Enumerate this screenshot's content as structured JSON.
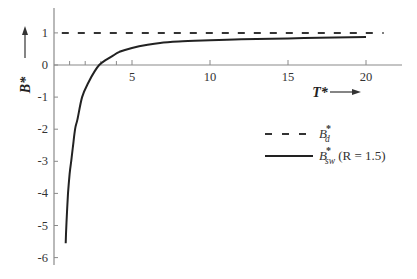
{
  "chart_data": {
    "type": "line",
    "title": "",
    "xlabel": "T*",
    "ylabel": "B*",
    "xlim": [
      0,
      21.5
    ],
    "ylim": [
      -6.2,
      1.7
    ],
    "x_ticks": [
      5,
      10,
      15,
      20
    ],
    "x_minor_ticks": [
      1,
      2,
      3,
      4
    ],
    "y_ticks": [
      1,
      0,
      -1,
      -2,
      -3,
      -4,
      -5,
      -6
    ],
    "x_tick_labels": [
      "5",
      "10",
      "15",
      "20"
    ],
    "y_tick_labels": [
      "1",
      "0",
      "-1",
      "-2",
      "-3",
      "-4",
      "-5",
      "-6"
    ],
    "grid": false,
    "legend_position": "right-center",
    "series": [
      {
        "name": "B*_d",
        "style": "dashed",
        "x": [
          0.5,
          20.5
        ],
        "y": [
          1,
          1
        ]
      },
      {
        "name": "B*_sw (R = 1.5)",
        "style": "solid",
        "x": [
          0.75,
          0.8,
          0.9,
          1.0,
          1.1,
          1.2,
          1.35,
          1.5,
          1.8,
          2.2,
          2.6,
          2.9,
          3.3,
          3.8,
          4.2,
          5.0,
          6.0,
          6.8,
          8.0,
          10.0,
          12.0,
          15.0,
          18.0,
          20.0
        ],
        "y": [
          -5.55,
          -4.9,
          -4.0,
          -3.4,
          -3.0,
          -2.6,
          -2.0,
          -1.7,
          -1.0,
          -0.55,
          -0.2,
          0.0,
          0.15,
          0.3,
          0.41,
          0.53,
          0.63,
          0.69,
          0.73,
          0.77,
          0.8,
          0.83,
          0.86,
          0.87
        ]
      }
    ]
  },
  "axes": {
    "x_label": "T*",
    "y_label": "B*",
    "x_arrow": "→",
    "y_arrow": "↑"
  },
  "legend": {
    "items": [
      {
        "base": "B",
        "sup": "*",
        "sub": "d",
        "suffix": ""
      },
      {
        "base": "B",
        "sup": "*",
        "sub": "sw",
        "suffix": " (R = 1.5)"
      }
    ]
  }
}
